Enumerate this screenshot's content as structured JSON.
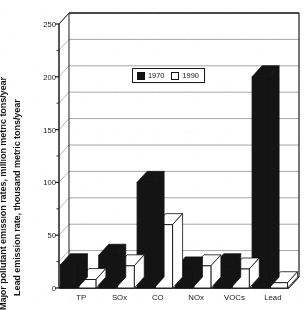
{
  "chart_data": {
    "type": "bar",
    "title": "",
    "subtitle": "",
    "categories": [
      "TP",
      "SOx",
      "CO",
      "NOx",
      "VOCs",
      "Lead"
    ],
    "series": [
      {
        "name": "1970",
        "values": [
          22,
          31,
          100,
          19,
          22,
          200
        ],
        "color": "#141414"
      },
      {
        "name": "1990",
        "values": [
          8,
          21,
          60,
          21,
          18,
          5
        ],
        "color": "#ffffff"
      }
    ],
    "xlabel": "",
    "ylabel_line_1": "Major pollutant emission rates, million metric tons/year",
    "ylabel_line_2": "Lead emission rate, thousand metric tons/year",
    "ylim": [
      0,
      250
    ],
    "ytick_labels": [
      "0",
      "50",
      "100",
      "150",
      "200",
      "250"
    ],
    "ytick_values": [
      0,
      50,
      100,
      150,
      200,
      250
    ],
    "yminor_step": 25,
    "grid": true,
    "grid_values": [
      25,
      50,
      75,
      100,
      125,
      150,
      175,
      200,
      225,
      250
    ],
    "legend": {
      "position": "upper-center",
      "entries": [
        {
          "label": "1970",
          "swatch": "filled-black-square"
        },
        {
          "label": "1990",
          "swatch": "open-white-square"
        }
      ]
    },
    "style": {
      "three_d": true,
      "background": "#ffffff",
      "axis_color": "#1c1c1c",
      "grid_color": "#8a8a8a",
      "bar_outline": "#101010"
    }
  }
}
